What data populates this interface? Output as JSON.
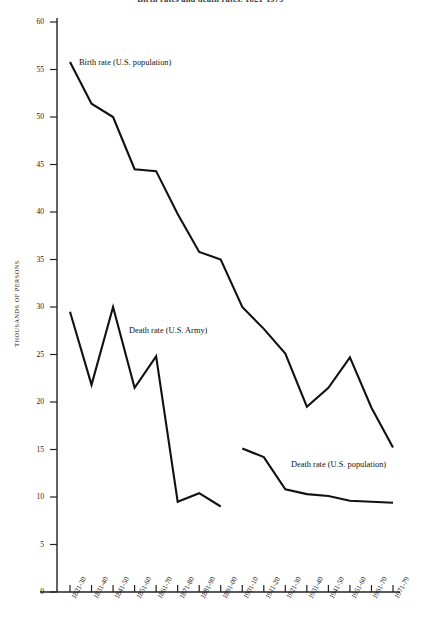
{
  "chart_data": {
    "type": "line",
    "title": "Birth rates and death rates, 1821-1979",
    "xlabel": "",
    "ylabel": "THOUSANDS OF PERSONS",
    "ylim": [
      0,
      60
    ],
    "ytick_step": 5,
    "yticks": [
      "0",
      "5",
      "10",
      "15",
      "20",
      "25",
      "30",
      "35",
      "40",
      "45",
      "50",
      "55",
      "60"
    ],
    "grid": false,
    "legend_position": "inline-annotations",
    "categories": [
      "1821-30",
      "1831-40",
      "1841-50",
      "1851-60",
      "1861-70",
      "1871-80",
      "1881-90",
      "1891-00",
      "1901-10",
      "1911-20",
      "1921-30",
      "1931-40",
      "1941-50",
      "1951-60",
      "1961-70",
      "1971-79"
    ],
    "series": [
      {
        "name": "Birth rate (U.S. population)",
        "annotation": "Birth rate (U.S. population)",
        "values": [
          55.8,
          51.4,
          50.0,
          44.5,
          44.3,
          39.8,
          35.8,
          35.0,
          30.0,
          27.7,
          25.1,
          19.5,
          21.5,
          24.7,
          19.4,
          15.2
        ]
      },
      {
        "name": "Death rate (U.S. Army)",
        "annotation": "Death rate (U.S. Army)",
        "values": [
          29.5,
          21.8,
          30.0,
          21.5,
          24.8,
          9.5,
          10.4,
          9.0,
          null,
          null,
          null,
          null,
          null,
          null,
          null,
          null
        ]
      },
      {
        "name": "Death rate (U.S. population)",
        "annotation": "Death rate (U.S. population)",
        "values": [
          null,
          null,
          null,
          null,
          null,
          null,
          null,
          null,
          15.1,
          14.2,
          10.8,
          10.3,
          10.1,
          9.6,
          9.5,
          9.4
        ]
      }
    ],
    "colors": {
      "line": "#111111",
      "axis": "#222222",
      "text": "#1a1a1a"
    },
    "caption": ""
  }
}
